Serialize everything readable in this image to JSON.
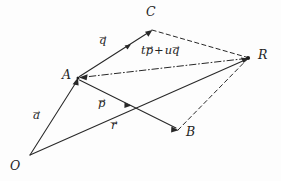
{
  "figure": {
    "background_color": "#fdfdfd",
    "ink_color": "#282828",
    "width": 281,
    "height": 181,
    "points": [
      {
        "id": "O",
        "label": "O",
        "x": 30,
        "y": 155,
        "label_x": 10,
        "label_y": 160
      },
      {
        "id": "A",
        "label": "A",
        "x": 78,
        "y": 78,
        "label_x": 62,
        "label_y": 69
      },
      {
        "id": "C",
        "label": "C",
        "x": 152,
        "y": 30,
        "label_x": 146,
        "label_y": 6
      },
      {
        "id": "B",
        "label": "B",
        "x": 178,
        "y": 130,
        "label_x": 186,
        "label_y": 126
      },
      {
        "id": "R",
        "label": "R",
        "x": 248,
        "y": 58,
        "label_x": 258,
        "label_y": 49
      }
    ],
    "vectors": [
      {
        "id": "a",
        "label": "a",
        "label_kind": "arrow-over",
        "from": "O",
        "to": "A",
        "style": "solid",
        "head": "end",
        "label_x": 33,
        "label_y": 110
      },
      {
        "id": "q",
        "label": "q",
        "label_kind": "arrow-over",
        "from": "A",
        "to": "C",
        "style": "solid",
        "head": "end-and-mid",
        "label_x": 99,
        "label_y": 35
      },
      {
        "id": "p",
        "label": "p",
        "label_kind": "arrow-over",
        "from": "A",
        "to": "B",
        "style": "solid",
        "head": "end-and-mid",
        "label_x": 98,
        "label_y": 98
      },
      {
        "id": "r",
        "label": "r",
        "label_kind": "arrow-over",
        "from": "O",
        "to": "R",
        "style": "solid",
        "head": "end",
        "label_x": 111,
        "label_y": 120
      }
    ],
    "construction_lines": [
      {
        "id": "CR",
        "from": "C",
        "to": "R",
        "style": "dashed",
        "head": "none"
      },
      {
        "id": "BR",
        "from": "B",
        "to": "R",
        "style": "dashed",
        "head": "none"
      },
      {
        "id": "RA",
        "from": "R",
        "to": "A",
        "style": "dashdot",
        "head": "end"
      }
    ],
    "expression": {
      "id": "tp-plus-uq",
      "text": "t p⃗ + u q⃗",
      "scalar_1": "t",
      "vector_1": "p",
      "operator": "+",
      "scalar_2": "u",
      "vector_2": "q",
      "x": 141,
      "y": 45
    }
  }
}
